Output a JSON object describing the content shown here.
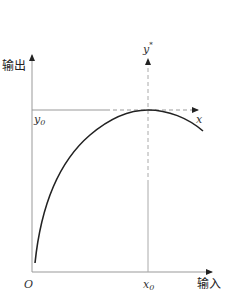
{
  "diagram": {
    "type": "input-output curve with optimum point",
    "axes": {
      "y_label": "输出",
      "x_label": "输入",
      "origin_label": "O"
    },
    "reference_lines": {
      "horizontal_label": "x",
      "vertical_label": "y",
      "vertical_label_superscript": "*",
      "y_marker": "y",
      "y_marker_sub": "0",
      "x_marker": "x",
      "x_marker_sub": "0"
    },
    "curve": {
      "description": "concave curve rising from near origin to a maximum at (x0, y0), then decreasing",
      "color": "#222222"
    },
    "colors": {
      "axis": "#999999",
      "dashed": "#aaaaaa",
      "curve": "#222222",
      "text": "#333333"
    }
  }
}
